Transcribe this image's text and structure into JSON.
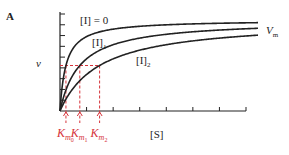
{
  "panel_label": "A",
  "chart_data": {
    "type": "line",
    "title": "",
    "xlabel": "[S]",
    "ylabel": "v",
    "colors": {
      "curves": "#222222",
      "guides": "#d6333a"
    },
    "series": [
      {
        "name": "[I] = 0",
        "label_main": "[I] = 0",
        "label_sub": "",
        "Km": 0.3,
        "Vmax": 1.0
      },
      {
        "name": "[I]1",
        "label_main": "[I]",
        "label_sub": "1",
        "Km": 1.0,
        "Vmax": 1.0
      },
      {
        "name": "[I]2",
        "label_main": "[I]",
        "label_sub": "2",
        "Km": 2.0,
        "Vmax": 1.0
      }
    ],
    "asymptote_label": {
      "main": "V",
      "sub": "m"
    },
    "half_vmax_line": 0.5,
    "km_labels": [
      {
        "main": "K",
        "sub": "m",
        "subsub": "0"
      },
      {
        "main": "K",
        "sub": "m",
        "subsub": "1"
      },
      {
        "main": "K",
        "sub": "m",
        "subsub": "2"
      }
    ],
    "xlim": [
      0,
      10
    ],
    "ylim": [
      0,
      1.1
    ],
    "grid": false,
    "x_ticks": 7,
    "y_ticks": 9,
    "legend": "inline labels"
  }
}
